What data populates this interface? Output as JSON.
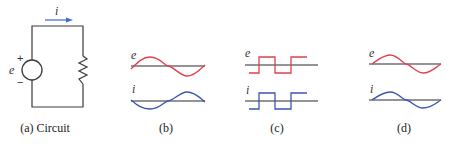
{
  "colors": {
    "wire": "#3a3a3a",
    "axis": "#2a2a2a",
    "voltage": "#e0404e",
    "current": "#3a55b0",
    "arrow": "#3a6fc4"
  },
  "circuit": {
    "current_label": "i",
    "source_label": "e",
    "plus_sign": "+",
    "minus_sign": "−",
    "caption": "(a) Circuit"
  },
  "panels": [
    {
      "id": "b",
      "caption": "(b)",
      "top_label": "e",
      "bottom_label": "i",
      "waveform": "sine",
      "phase": "current inverted relative to voltage"
    },
    {
      "id": "c",
      "caption": "(c)",
      "top_label": "e",
      "bottom_label": "i",
      "waveform": "square",
      "phase": "in phase"
    },
    {
      "id": "d",
      "caption": "(d)",
      "top_label": "e",
      "bottom_label": "i",
      "waveform": "sine",
      "phase": "in phase"
    }
  ]
}
